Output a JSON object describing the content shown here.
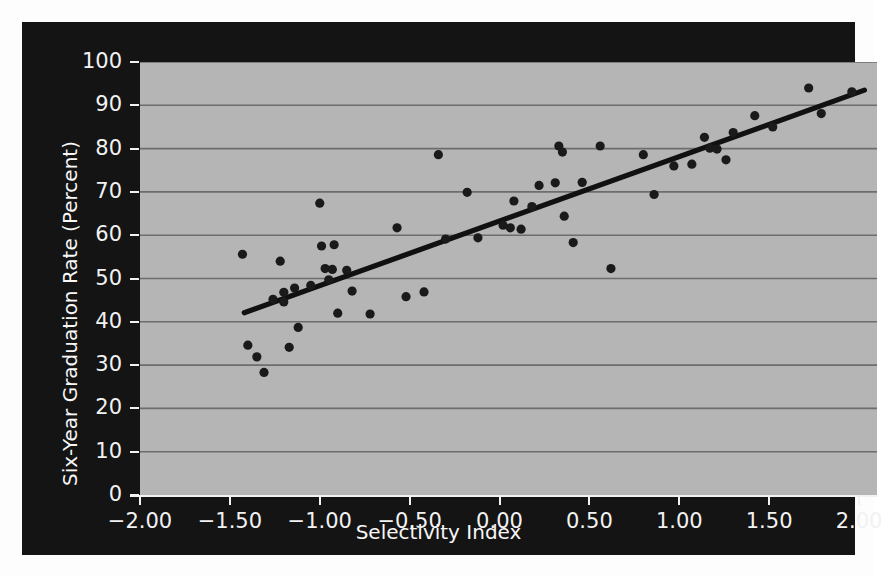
{
  "chart_data": {
    "type": "scatter",
    "title": "",
    "xlabel": "Selectivity Index",
    "ylabel": "Six-Year Graduation Rate (Percent)",
    "xlim": [
      -2.0,
      2.1
    ],
    "ylim": [
      0,
      100
    ],
    "xticks": [
      "-2.00",
      "-1.50",
      "-1.00",
      "-0.50",
      "0.00",
      "0.50",
      "1.00",
      "1.50",
      "2.00"
    ],
    "xtick_values": [
      -2.0,
      -1.5,
      -1.0,
      -0.5,
      0.0,
      0.5,
      1.0,
      1.5,
      2.0
    ],
    "yticks": [
      "0",
      "10",
      "20",
      "30",
      "40",
      "50",
      "60",
      "70",
      "80",
      "90",
      "100"
    ],
    "ytick_values": [
      0,
      10,
      20,
      30,
      40,
      50,
      60,
      70,
      80,
      90,
      100
    ],
    "grid": "horizontal",
    "legend": "none",
    "plot_background": "#b5b5b5",
    "panel_background": "#141414",
    "gridline_color": "#6d6d6d",
    "marker_color": "#1a1a1a",
    "trendline_color": "#111111",
    "marker_radius": 4.6,
    "trendline": {
      "x0": -1.42,
      "y0": 42.1,
      "x1": 2.03,
      "y1": 93.5,
      "slope": 14.9,
      "intercept": 63.3
    },
    "points": [
      {
        "x": -1.43,
        "y": 55.6
      },
      {
        "x": -1.4,
        "y": 34.6
      },
      {
        "x": -1.35,
        "y": 31.9
      },
      {
        "x": -1.31,
        "y": 28.3
      },
      {
        "x": -1.26,
        "y": 45.2
      },
      {
        "x": -1.22,
        "y": 54.0
      },
      {
        "x": -1.2,
        "y": 46.8
      },
      {
        "x": -1.2,
        "y": 44.6
      },
      {
        "x": -1.17,
        "y": 34.1
      },
      {
        "x": -1.14,
        "y": 47.8
      },
      {
        "x": -1.12,
        "y": 38.7
      },
      {
        "x": -1.05,
        "y": 48.4
      },
      {
        "x": -1.0,
        "y": 67.4
      },
      {
        "x": -0.99,
        "y": 57.5
      },
      {
        "x": -0.97,
        "y": 52.3
      },
      {
        "x": -0.95,
        "y": 49.7
      },
      {
        "x": -0.93,
        "y": 52.1
      },
      {
        "x": -0.92,
        "y": 57.8
      },
      {
        "x": -0.9,
        "y": 42.0
      },
      {
        "x": -0.85,
        "y": 51.9
      },
      {
        "x": -0.82,
        "y": 47.1
      },
      {
        "x": -0.72,
        "y": 41.8
      },
      {
        "x": -0.57,
        "y": 61.7
      },
      {
        "x": -0.52,
        "y": 45.8
      },
      {
        "x": -0.42,
        "y": 46.9
      },
      {
        "x": -0.34,
        "y": 78.6
      },
      {
        "x": -0.3,
        "y": 59.1
      },
      {
        "x": -0.18,
        "y": 69.9
      },
      {
        "x": -0.12,
        "y": 59.4
      },
      {
        "x": 0.02,
        "y": 62.3
      },
      {
        "x": 0.06,
        "y": 61.7
      },
      {
        "x": 0.08,
        "y": 67.9
      },
      {
        "x": 0.12,
        "y": 61.4
      },
      {
        "x": 0.18,
        "y": 66.6
      },
      {
        "x": 0.22,
        "y": 71.5
      },
      {
        "x": 0.31,
        "y": 72.1
      },
      {
        "x": 0.33,
        "y": 80.6
      },
      {
        "x": 0.35,
        "y": 79.2
      },
      {
        "x": 0.36,
        "y": 64.4
      },
      {
        "x": 0.41,
        "y": 58.3
      },
      {
        "x": 0.46,
        "y": 72.2
      },
      {
        "x": 0.56,
        "y": 80.6
      },
      {
        "x": 0.62,
        "y": 52.3
      },
      {
        "x": 0.8,
        "y": 78.6
      },
      {
        "x": 0.86,
        "y": 69.4
      },
      {
        "x": 0.97,
        "y": 76.0
      },
      {
        "x": 1.07,
        "y": 76.4
      },
      {
        "x": 1.14,
        "y": 82.6
      },
      {
        "x": 1.17,
        "y": 80.1
      },
      {
        "x": 1.21,
        "y": 79.9
      },
      {
        "x": 1.26,
        "y": 77.4
      },
      {
        "x": 1.3,
        "y": 83.7
      },
      {
        "x": 1.42,
        "y": 87.6
      },
      {
        "x": 1.52,
        "y": 85.0
      },
      {
        "x": 1.72,
        "y": 94.0
      },
      {
        "x": 1.79,
        "y": 88.1
      },
      {
        "x": 1.96,
        "y": 93.1
      }
    ]
  },
  "axes": {
    "x_axis_label": "Selectivity Index",
    "y_axis_label": "Six-Year Graduation Rate (Percent)"
  }
}
